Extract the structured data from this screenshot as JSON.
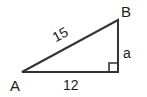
{
  "figure": {
    "background_color": "#ffffff",
    "stroke_color": "#333333",
    "text_color": "#1c1c1c",
    "stroke_width": 2
  },
  "vertices": {
    "a": {
      "label": "A",
      "x": 22,
      "y": 72
    },
    "b": {
      "label": "B",
      "x": 118,
      "y": 20
    },
    "c": {
      "label": "",
      "x": 118,
      "y": 72
    }
  },
  "sides": {
    "hypotenuse": {
      "label": "15",
      "value": 15,
      "from": "A",
      "to": "B"
    },
    "base": {
      "label": "12",
      "value": 12,
      "from": "A",
      "to": "C"
    },
    "vertical": {
      "label": "a",
      "value": null,
      "from": "C",
      "to": "B"
    }
  },
  "markers": {
    "right_angle": {
      "name": "right-angle-square",
      "at": "C",
      "size": 9
    }
  },
  "chart_data": {
    "type": "diagram",
    "shape": "right_triangle",
    "labels": [
      "A",
      "B",
      "15",
      "12",
      "a"
    ],
    "known_sides": {
      "hypotenuse": 15,
      "adjacent": 12
    },
    "unknown_sides": {
      "opposite": "a"
    },
    "right_angle_vertex": "C"
  }
}
